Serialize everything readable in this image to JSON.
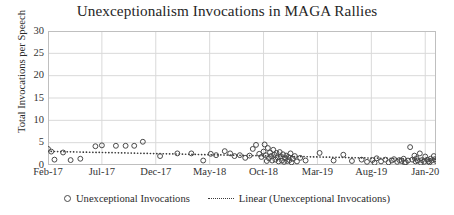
{
  "chart_data": {
    "type": "scatter",
    "title": "Unexceptionalism Invocations in MAGA Rallies",
    "xlabel": "",
    "ylabel": "Total Invocations per Speech",
    "ylim": [
      0,
      30
    ],
    "yticks": [
      0,
      5,
      10,
      15,
      20,
      25,
      30
    ],
    "ytick_labels": [
      "0",
      "5",
      "10",
      "15",
      "20",
      "25",
      "30"
    ],
    "xlim": [
      0,
      36
    ],
    "xticks": [
      0,
      5,
      10,
      15,
      20,
      25,
      30,
      35
    ],
    "xtick_labels": [
      "Feb-17",
      "Jul-17",
      "Dec-17",
      "May-18",
      "Oct-18",
      "Mar-19",
      "Aug-19",
      "Jan-20"
    ],
    "grid": "horizontal-and-vertical",
    "legend_position": "bottom",
    "marker": "open-circle",
    "series": [
      {
        "name": "Unexceptional Invocations",
        "type": "scatter",
        "points": [
          [
            0.0,
            3.6
          ],
          [
            0.3,
            3.0
          ],
          [
            0.6,
            1.2
          ],
          [
            1.4,
            2.8
          ],
          [
            2.1,
            1.1
          ],
          [
            3.0,
            1.4
          ],
          [
            4.4,
            4.2
          ],
          [
            5.0,
            4.4
          ],
          [
            6.3,
            4.3
          ],
          [
            7.2,
            4.3
          ],
          [
            8.0,
            4.3
          ],
          [
            8.8,
            5.2
          ],
          [
            10.4,
            2.0
          ],
          [
            12.0,
            2.6
          ],
          [
            13.3,
            2.6
          ],
          [
            14.4,
            1.0
          ],
          [
            15.1,
            2.5
          ],
          [
            15.6,
            2.2
          ],
          [
            16.4,
            3.1
          ],
          [
            16.9,
            2.6
          ],
          [
            17.3,
            2.0
          ],
          [
            17.8,
            2.2
          ],
          [
            18.3,
            1.6
          ],
          [
            18.7,
            2.1
          ],
          [
            19.0,
            3.6
          ],
          [
            19.3,
            4.5
          ],
          [
            19.6,
            2.5
          ],
          [
            19.8,
            1.8
          ],
          [
            20.0,
            3.0
          ],
          [
            20.1,
            4.6
          ],
          [
            20.2,
            2.2
          ],
          [
            20.3,
            0.9
          ],
          [
            20.4,
            3.8
          ],
          [
            20.5,
            1.5
          ],
          [
            20.6,
            2.8
          ],
          [
            20.7,
            2.0
          ],
          [
            20.8,
            1.0
          ],
          [
            20.9,
            3.4
          ],
          [
            21.0,
            2.3
          ],
          [
            21.1,
            1.2
          ],
          [
            21.2,
            2.7
          ],
          [
            21.3,
            1.7
          ],
          [
            21.4,
            0.8
          ],
          [
            21.5,
            2.9
          ],
          [
            21.6,
            1.9
          ],
          [
            21.7,
            1.0
          ],
          [
            21.8,
            2.4
          ],
          [
            21.9,
            0.7
          ],
          [
            22.0,
            1.5
          ],
          [
            22.1,
            2.1
          ],
          [
            22.2,
            0.9
          ],
          [
            22.3,
            1.8
          ],
          [
            22.4,
            1.1
          ],
          [
            22.5,
            2.6
          ],
          [
            22.6,
            0.6
          ],
          [
            22.7,
            1.4
          ],
          [
            22.9,
            2.0
          ],
          [
            23.1,
            0.8
          ],
          [
            23.4,
            1.6
          ],
          [
            23.9,
            1.0
          ],
          [
            25.2,
            2.7
          ],
          [
            26.5,
            1.0
          ],
          [
            27.4,
            2.3
          ],
          [
            28.2,
            0.9
          ],
          [
            29.1,
            1.2
          ],
          [
            29.6,
            0.7
          ],
          [
            30.1,
            1.1
          ],
          [
            30.5,
            1.5
          ],
          [
            30.9,
            0.8
          ],
          [
            31.3,
            1.2
          ],
          [
            31.6,
            0.6
          ],
          [
            31.9,
            1.0
          ],
          [
            32.1,
            1.3
          ],
          [
            32.4,
            0.7
          ],
          [
            32.6,
            1.1
          ],
          [
            32.8,
            0.9
          ],
          [
            33.0,
            1.4
          ],
          [
            33.2,
            0.6
          ],
          [
            33.4,
            1.0
          ],
          [
            33.6,
            4.0
          ],
          [
            33.8,
            1.2
          ],
          [
            34.0,
            2.1
          ],
          [
            34.1,
            0.8
          ],
          [
            34.2,
            1.5
          ],
          [
            34.3,
            1.0
          ],
          [
            34.5,
            2.6
          ],
          [
            34.7,
            1.1
          ],
          [
            34.9,
            0.7
          ],
          [
            35.0,
            1.9
          ],
          [
            35.2,
            1.2
          ],
          [
            35.3,
            0.8
          ],
          [
            35.5,
            1.4
          ],
          [
            35.6,
            1.0
          ],
          [
            35.8,
            2.0
          ],
          [
            35.9,
            1.3
          ],
          [
            36.0,
            0.9
          ],
          [
            35.4,
            0.6
          ],
          [
            34.6,
            0.5
          ],
          [
            33.1,
            0.5
          ],
          [
            30.3,
            0.5
          ]
        ]
      },
      {
        "name": "Linear (Unexceptional Invocations)",
        "type": "line",
        "style": "dotted",
        "endpoints": [
          [
            0.0,
            3.05
          ],
          [
            36.0,
            1.25
          ]
        ]
      }
    ],
    "legend": [
      {
        "label": "Unexceptional Invocations",
        "marker": "open-circle"
      },
      {
        "label": "Linear (Unexceptional Invocations)",
        "marker": "dotted-line"
      }
    ],
    "colors": {
      "marker_stroke": "#4a4a4a",
      "trendline": "#3a3a3a",
      "grid": "#d9d9d9",
      "axis": "#bfbfbf",
      "text": "#262626",
      "background": "#ffffff"
    }
  }
}
